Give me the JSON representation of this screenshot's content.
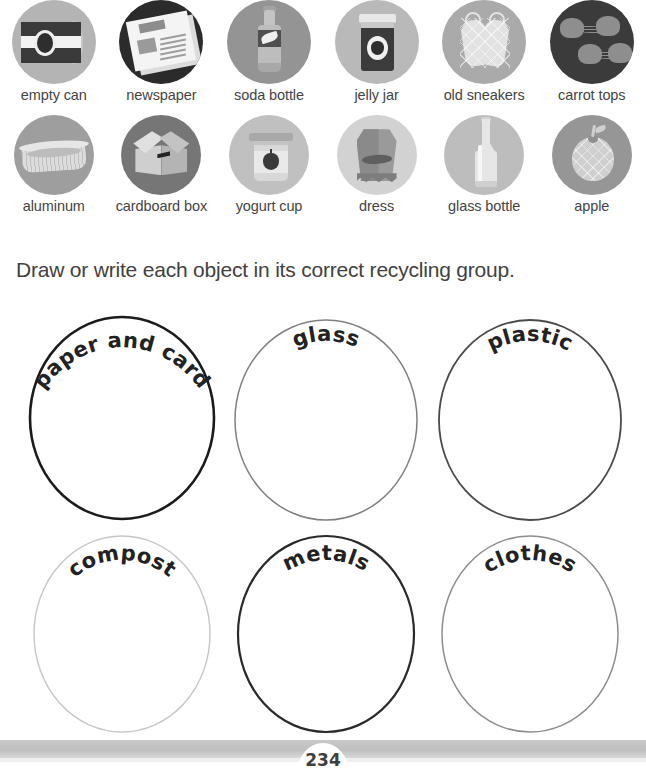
{
  "worksheet": {
    "instruction": "Draw or write each object in its correct recycling group.",
    "page_number": "234"
  },
  "picture_bank": {
    "rows": [
      {
        "items": [
          {
            "label": "empty can",
            "icon": "empty-can-icon",
            "circle_color": "#b4b4b4"
          },
          {
            "label": "newspaper",
            "icon": "newspaper-icon",
            "circle_color": "#2b2b2b"
          },
          {
            "label": "soda bottle",
            "icon": "soda-bottle-icon",
            "circle_color": "#949494"
          },
          {
            "label": "jelly jar",
            "icon": "jelly-jar-icon",
            "circle_color": "#b9b9b9"
          },
          {
            "label": "old sneakers",
            "icon": "old-sneakers-icon",
            "circle_color": "#aaaaaa"
          },
          {
            "label": "carrot tops",
            "icon": "carrot-tops-icon",
            "circle_color": "#3b3b3b"
          }
        ]
      },
      {
        "items": [
          {
            "label": "aluminum",
            "icon": "aluminum-tray-icon",
            "circle_color": "#9e9e9e"
          },
          {
            "label": "cardboard box",
            "icon": "cardboard-box-icon",
            "circle_color": "#767676"
          },
          {
            "label": "yogurt cup",
            "icon": "yogurt-cup-icon",
            "circle_color": "#c0c0c0"
          },
          {
            "label": "dress",
            "icon": "dress-icon",
            "circle_color": "#d2d2d2"
          },
          {
            "label": "glass bottle",
            "icon": "glass-bottle-icon",
            "circle_color": "#bdbdbd"
          },
          {
            "label": "apple",
            "icon": "apple-icon",
            "circle_color": "#969696"
          }
        ]
      }
    ]
  },
  "sorting_groups": [
    {
      "label": "paper and card",
      "stroke_color": "#1b1b1b",
      "stroke_width": "2.6",
      "curve": "strong"
    },
    {
      "label": "glass",
      "stroke_color": "#808080",
      "stroke_width": "1.5",
      "curve": "soft"
    },
    {
      "label": "plastic",
      "stroke_color": "#4a4a4a",
      "stroke_width": "1.8",
      "curve": "soft"
    },
    {
      "label": "compost",
      "stroke_color": "#c6c6c6",
      "stroke_width": "1.4",
      "curve": "soft"
    },
    {
      "label": "metals",
      "stroke_color": "#2a2a2a",
      "stroke_width": "2.2",
      "curve": "soft"
    },
    {
      "label": "clothes",
      "stroke_color": "#8d8d8d",
      "stroke_width": "1.5",
      "curve": "soft"
    }
  ]
}
